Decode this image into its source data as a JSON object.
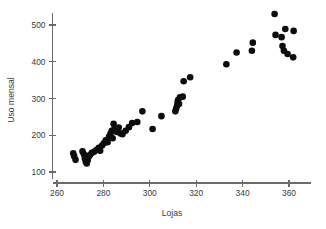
{
  "chart_data": {
    "type": "scatter",
    "title": "",
    "subtitle": "",
    "xlabel": "Lojas",
    "ylabel": "Uso mensal",
    "xlim": [
      255,
      368
    ],
    "ylim": [
      85,
      545
    ],
    "xticks": [
      260,
      280,
      300,
      320,
      340,
      360
    ],
    "yticks": [
      100,
      200,
      300,
      400,
      500
    ],
    "xtick_labels": [
      "260",
      "280",
      "300",
      "320",
      "340",
      "360"
    ],
    "ytick_labels": [
      "100",
      "200",
      "300",
      "400",
      "500"
    ],
    "grid": false,
    "legend": null,
    "marker": "filled-circle",
    "marker_color": "#0d0d0d",
    "marker_size": 4.6,
    "n_points": 60,
    "points": [
      [
        267.0,
        151.0
      ],
      [
        267.4,
        143.0
      ],
      [
        268.0,
        133.0
      ],
      [
        271.0,
        156.0
      ],
      [
        271.6,
        148.0
      ],
      [
        272.0,
        137.0
      ],
      [
        272.4,
        128.0
      ],
      [
        272.8,
        123.0
      ],
      [
        273.2,
        131.0
      ],
      [
        273.6,
        141.0
      ],
      [
        274.2,
        146.0
      ],
      [
        275.0,
        152.0
      ],
      [
        276.0,
        155.0
      ],
      [
        277.0,
        160.0
      ],
      [
        278.0,
        166.0
      ],
      [
        278.6,
        158.0
      ],
      [
        279.4,
        172.0
      ],
      [
        280.2,
        178.0
      ],
      [
        281.0,
        186.0
      ],
      [
        281.8,
        181.0
      ],
      [
        282.4,
        196.0
      ],
      [
        283.0,
        203.0
      ],
      [
        283.6,
        212.0
      ],
      [
        284.0,
        192.0
      ],
      [
        284.4,
        231.0
      ],
      [
        284.8,
        219.0
      ],
      [
        285.2,
        213.0
      ],
      [
        285.8,
        209.0
      ],
      [
        286.6,
        221.0
      ],
      [
        287.4,
        205.0
      ],
      [
        288.2,
        203.0
      ],
      [
        289.6,
        212.0
      ],
      [
        291.0,
        222.0
      ],
      [
        292.4,
        233.0
      ],
      [
        294.6,
        236.0
      ],
      [
        296.8,
        265.0
      ],
      [
        301.2,
        217.0
      ],
      [
        305.0,
        252.0
      ],
      [
        311.0,
        265.0
      ],
      [
        311.4,
        273.0
      ],
      [
        311.8,
        281.0
      ],
      [
        312.0,
        290.0
      ],
      [
        312.2,
        296.0
      ],
      [
        312.6,
        285.0
      ],
      [
        313.0,
        303.0
      ],
      [
        314.2,
        305.0
      ],
      [
        314.6,
        347.0
      ],
      [
        317.4,
        358.0
      ],
      [
        333.0,
        393.0
      ],
      [
        337.4,
        425.0
      ],
      [
        344.0,
        430.0
      ],
      [
        344.4,
        452.0
      ],
      [
        353.8,
        530.0
      ],
      [
        354.2,
        473.0
      ],
      [
        356.8,
        467.0
      ],
      [
        357.2,
        443.0
      ],
      [
        357.8,
        430.0
      ],
      [
        358.4,
        489.0
      ],
      [
        359.4,
        421.0
      ],
      [
        361.8,
        412.0
      ],
      [
        362.0,
        484.0
      ]
    ]
  },
  "axes": {
    "x_axis_name": "x-axis",
    "y_axis_name": "y-axis"
  }
}
